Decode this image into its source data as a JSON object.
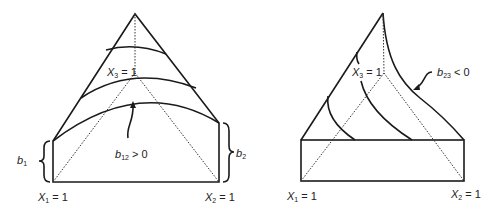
{
  "diagrams": [
    {
      "id": "left",
      "labels": {
        "x1": {
          "var": "X",
          "sub": "1",
          "rest": " = 1"
        },
        "x2": {
          "var": "X",
          "sub": "2",
          "rest": " = 1"
        },
        "x3": {
          "var": "X",
          "sub": "3",
          "rest": " = 1"
        },
        "b1": {
          "var": "b",
          "sub": "1"
        },
        "b2": {
          "var": "b",
          "sub": "2"
        },
        "annotation": {
          "var": "b",
          "sub": "12",
          "rest": " > 0"
        }
      }
    },
    {
      "id": "right",
      "labels": {
        "x1": {
          "var": "X",
          "sub": "1",
          "rest": " = 1"
        },
        "x2": {
          "var": "X",
          "sub": "2",
          "rest": " = 1"
        },
        "x3": {
          "var": "X",
          "sub": "3",
          "rest": " = 1"
        },
        "annotation": {
          "var": "b",
          "sub": "23",
          "rest": " < 0"
        }
      }
    }
  ]
}
